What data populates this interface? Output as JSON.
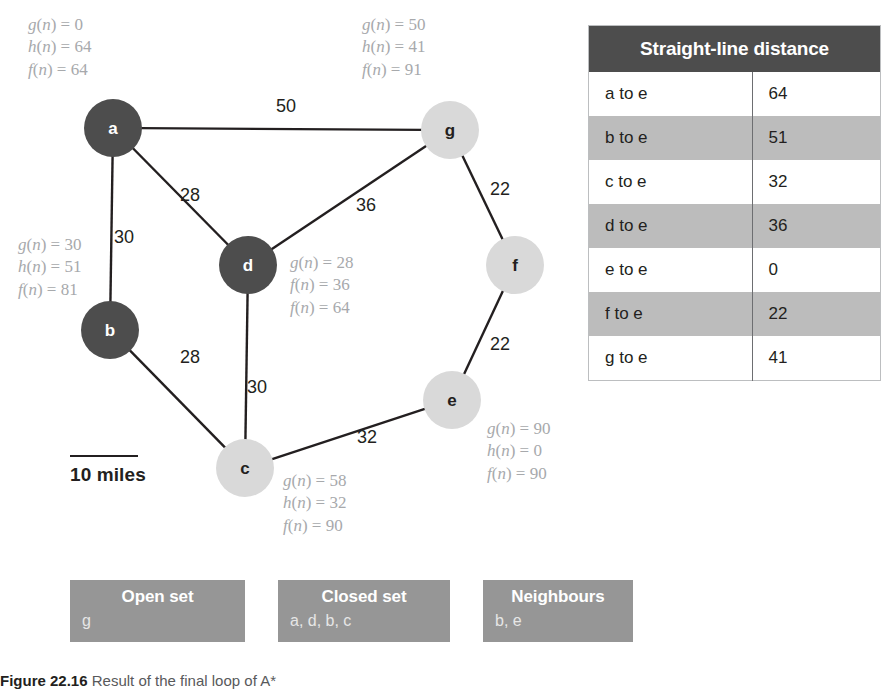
{
  "graph": {
    "nodes": [
      {
        "id": "a",
        "label": "a",
        "cx": 113,
        "cy": 128,
        "r": 29,
        "fill": "#4d4d4d",
        "text_color": "#ffffff"
      },
      {
        "id": "g",
        "label": "g",
        "cx": 450,
        "cy": 130,
        "r": 29,
        "fill": "#d9d9d9",
        "text_color": "#231f20"
      },
      {
        "id": "d",
        "label": "d",
        "cx": 248,
        "cy": 265,
        "r": 29,
        "fill": "#4d4d4d",
        "text_color": "#ffffff"
      },
      {
        "id": "b",
        "label": "b",
        "cx": 110,
        "cy": 330,
        "r": 29,
        "fill": "#4d4d4d",
        "text_color": "#ffffff"
      },
      {
        "id": "f",
        "label": "f",
        "cx": 515,
        "cy": 265,
        "r": 29,
        "fill": "#d9d9d9",
        "text_color": "#231f20"
      },
      {
        "id": "e",
        "label": "e",
        "cx": 452,
        "cy": 400,
        "r": 29,
        "fill": "#d9d9d9",
        "text_color": "#231f20"
      },
      {
        "id": "c",
        "label": "c",
        "cx": 245,
        "cy": 468,
        "r": 29,
        "fill": "#d9d9d9",
        "text_color": "#231f20"
      }
    ],
    "edges": [
      {
        "from": "a",
        "to": "g",
        "weight": "50",
        "lx": 286,
        "ly": 112
      },
      {
        "from": "a",
        "to": "d",
        "weight": "28",
        "lx": 190,
        "ly": 201
      },
      {
        "from": "a",
        "to": "b",
        "weight": "30",
        "lx": 124,
        "ly": 243
      },
      {
        "from": "d",
        "to": "g",
        "weight": "36",
        "lx": 366,
        "ly": 211
      },
      {
        "from": "g",
        "to": "f",
        "weight": "22",
        "lx": 500,
        "ly": 195
      },
      {
        "from": "f",
        "to": "e",
        "weight": "22",
        "lx": 500,
        "ly": 350
      },
      {
        "from": "d",
        "to": "c",
        "weight": "30",
        "lx": 257,
        "ly": 393
      },
      {
        "from": "b",
        "to": "c",
        "weight": "28",
        "lx": 190,
        "ly": 363
      },
      {
        "from": "c",
        "to": "e",
        "weight": "32",
        "lx": 367,
        "ly": 443
      }
    ],
    "edge_color": "#231f20",
    "annotations": [
      {
        "node": "a",
        "x": 28,
        "y": 14,
        "lines": [
          "g(n) = 0",
          "h(n) = 64",
          "f(n) = 64"
        ]
      },
      {
        "node": "g",
        "x": 362,
        "y": 14,
        "lines": [
          "g(n) = 50",
          "h(n) = 41",
          "f(n) = 91"
        ]
      },
      {
        "node": "b",
        "x": 18,
        "y": 234,
        "lines": [
          "g(n) = 30",
          "h(n) = 51",
          "f(n) = 81"
        ]
      },
      {
        "node": "d",
        "x": 290,
        "y": 252,
        "lines": [
          "g(n) = 28",
          "f(n) = 36",
          "f(n) = 64"
        ]
      },
      {
        "node": "e",
        "x": 487,
        "y": 418,
        "lines": [
          "g(n) = 90",
          "h(n) = 0",
          "f(n) = 90"
        ]
      },
      {
        "node": "c",
        "x": 283,
        "y": 470,
        "lines": [
          "g(n) = 58",
          "h(n) = 32",
          "f(n) = 90"
        ]
      }
    ],
    "scale": {
      "label": "10 miles",
      "x": 70,
      "y": 455
    }
  },
  "table": {
    "header": "Straight-line distance",
    "rows": [
      {
        "label": "a to e",
        "value": "64",
        "shaded": false
      },
      {
        "label": "b to e",
        "value": "51",
        "shaded": true
      },
      {
        "label": "c to e",
        "value": "32",
        "shaded": false
      },
      {
        "label": "d to e",
        "value": "36",
        "shaded": true
      },
      {
        "label": "e to e",
        "value": "0",
        "shaded": false
      },
      {
        "label": "f to e",
        "value": "22",
        "shaded": true
      },
      {
        "label": "g to e",
        "value": "41",
        "shaded": false
      }
    ]
  },
  "sets": {
    "open": {
      "title": "Open set",
      "members": "g"
    },
    "closed": {
      "title": "Closed set",
      "members": "a, d, b, c"
    },
    "neighbours": {
      "title": "Neighbours",
      "members": "b, e"
    }
  },
  "caption": {
    "figure_number": "Figure 22.16",
    "text": "Result of the final loop of A*"
  },
  "colors": {
    "node_dark": "#4d4d4d",
    "node_light": "#d9d9d9",
    "table_header_bg": "#4d4d4d",
    "table_row_shaded": "#bcbcbc",
    "setbox_bg": "#969696",
    "annotation_text": "#a7a9ac"
  }
}
